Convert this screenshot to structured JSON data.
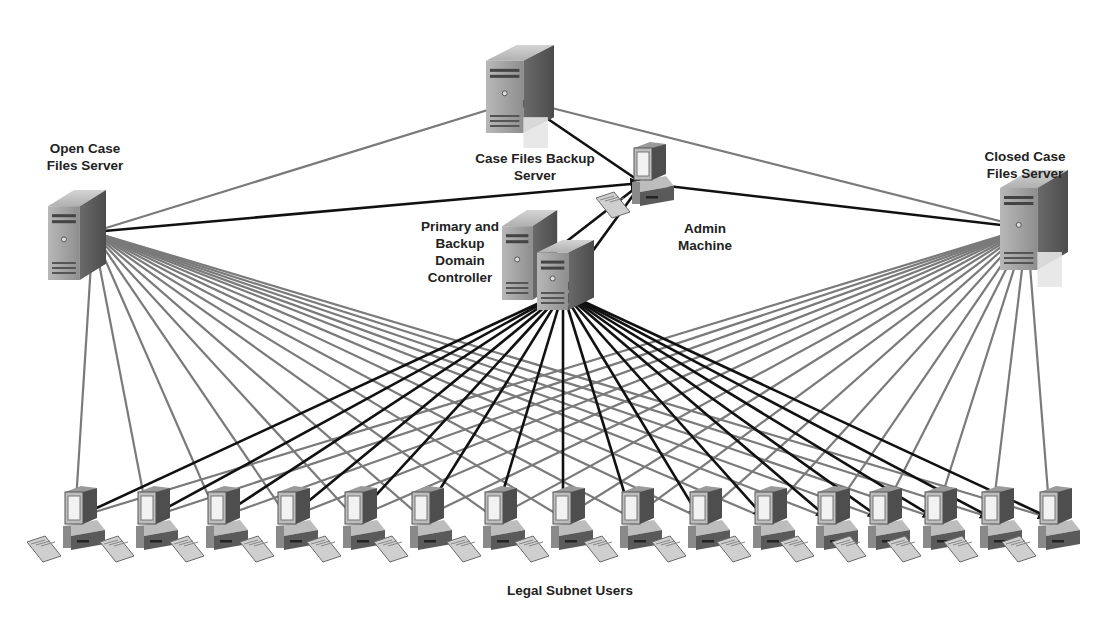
{
  "diagram": {
    "colors": {
      "background": "#ffffff",
      "gray_link": "#7a7a7a",
      "black_link": "#111111",
      "label": "#222222",
      "device_light": "#c9c9c9",
      "device_mid": "#9a9a9a",
      "device_dark": "#5c5c5c"
    },
    "nodes": {
      "open_server": {
        "label": "Open Case\nFiles Server",
        "hub": [
          93,
          232
        ],
        "box": [
          48,
          190,
          58,
          90
        ],
        "label_pos": [
          30,
          140,
          110
        ]
      },
      "backup_server": {
        "label": "Case Files Backup\nServer",
        "hub": [
          520,
          100
        ],
        "box": [
          486,
          45,
          68,
          88
        ],
        "label_pos": [
          455,
          150,
          160
        ]
      },
      "admin_machine": {
        "label": "Admin\nMachine",
        "hub": [
          642,
          183
        ],
        "box": [
          630,
          140,
          65,
          65
        ],
        "label_pos": [
          660,
          220,
          90
        ]
      },
      "domain_controller": {
        "label": "Primary and\nBackup\nDomain\nController",
        "hub": [
          563,
          292
        ],
        "box": [
          502,
          210,
          92,
          100
        ],
        "label_pos": [
          400,
          218,
          120
        ]
      },
      "closed_server": {
        "label": "Closed Case\nFiles Server",
        "hub": [
          1027,
          228
        ],
        "box": [
          1000,
          170,
          68,
          100
        ],
        "label_pos": [
          965,
          148,
          120
        ]
      }
    },
    "server_links": [
      {
        "from": "open_server",
        "to": "backup_server",
        "style": "gray"
      },
      {
        "from": "open_server",
        "to": "admin_machine",
        "style": "black"
      },
      {
        "from": "backup_server",
        "to": "closed_server",
        "style": "gray"
      },
      {
        "from": "admin_machine",
        "to": "backup_server",
        "style": "black"
      },
      {
        "from": "admin_machine",
        "to": "closed_server",
        "style": "black"
      },
      {
        "from": "admin_machine",
        "to": "domain_controller",
        "style": "black"
      },
      {
        "from": "admin_machine",
        "to": [
          540,
          262
        ],
        "style": "black"
      }
    ],
    "users": {
      "group_label": "Legal Subnet Users",
      "group_label_pos": [
        470,
        582,
        200
      ],
      "monitor_y": 490,
      "hub_y": 518,
      "workstation_x": [
        75,
        148,
        218,
        288,
        355,
        422,
        495,
        563,
        632,
        700,
        765,
        828,
        880,
        935,
        992,
        1050
      ]
    },
    "user_link_sources": [
      {
        "node": "open_server",
        "style": "gray"
      },
      {
        "node": "closed_server",
        "style": "gray"
      },
      {
        "node": "domain_controller",
        "style": "black"
      }
    ]
  }
}
